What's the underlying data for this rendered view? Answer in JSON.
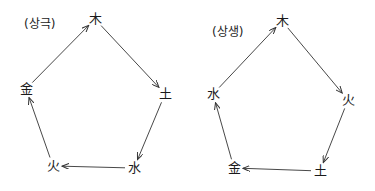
{
  "diagrams": [
    {
      "title": "(상극)",
      "title_pos": [
        24,
        22
      ],
      "nodes": [
        {
          "label": "木",
          "x": 95,
          "y": 19
        },
        {
          "label": "土",
          "x": 165,
          "y": 94
        },
        {
          "label": "水",
          "x": 134,
          "y": 168
        },
        {
          "label": "火",
          "x": 53,
          "y": 166
        },
        {
          "label": "金",
          "x": 26,
          "y": 89
        }
      ],
      "edges": [
        {
          "from": 0,
          "to": 1
        },
        {
          "from": 1,
          "to": 2
        },
        {
          "from": 2,
          "to": 3
        },
        {
          "from": 3,
          "to": 4
        },
        {
          "from": 4,
          "to": 0
        }
      ]
    },
    {
      "title": "(상생)",
      "title_pos": [
        212,
        30
      ],
      "nodes": [
        {
          "label": "木",
          "x": 282,
          "y": 21
        },
        {
          "label": "火",
          "x": 348,
          "y": 100
        },
        {
          "label": "土",
          "x": 320,
          "y": 171
        },
        {
          "label": "金",
          "x": 234,
          "y": 168
        },
        {
          "label": "水",
          "x": 213,
          "y": 94
        }
      ],
      "edges": [
        {
          "from": 0,
          "to": 1
        },
        {
          "from": 1,
          "to": 2
        },
        {
          "from": 2,
          "to": 3
        },
        {
          "from": 3,
          "to": 4
        },
        {
          "from": 4,
          "to": 0
        }
      ]
    }
  ],
  "colors": {
    "line": "#333333",
    "text": "#1a1a1a"
  }
}
